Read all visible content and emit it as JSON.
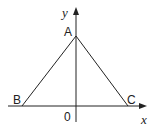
{
  "diagram": {
    "type": "coordinate-geometry",
    "axes": {
      "x_label": "x",
      "y_label": "y",
      "origin_label": "0"
    },
    "points": [
      {
        "name": "A",
        "position": "on y-axis above origin"
      },
      {
        "name": "B",
        "position": "on x-axis left of origin"
      },
      {
        "name": "C",
        "position": "on x-axis right of origin"
      }
    ],
    "segments": [
      "AB",
      "AC",
      "BC"
    ],
    "colors": {
      "line": "#222222",
      "background": "#ffffff"
    }
  }
}
